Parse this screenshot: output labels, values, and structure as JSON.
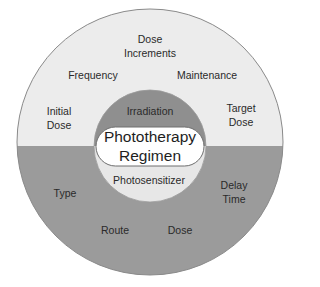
{
  "diagram": {
    "title": "Phototherapy Regimen",
    "center": {
      "line1": "Phototherapy",
      "line2": "Regimen"
    },
    "inner": {
      "top": "Irradiation",
      "bottom": "Photosensitizer"
    },
    "outer_top": {
      "items": [
        {
          "line1": "Initial",
          "line2": "Dose"
        },
        {
          "line1": "Frequency",
          "line2": ""
        },
        {
          "line1": "Dose",
          "line2": "Increments"
        },
        {
          "line1": "Maintenance",
          "line2": ""
        },
        {
          "line1": "Target",
          "line2": "Dose"
        }
      ]
    },
    "outer_bottom": {
      "items": [
        {
          "line1": "Type",
          "line2": ""
        },
        {
          "line1": "Route",
          "line2": ""
        },
        {
          "line1": "Dose",
          "line2": ""
        },
        {
          "line1": "Delay",
          "line2": "Time"
        }
      ]
    },
    "colors": {
      "light_fill": "#ececec",
      "dark_fill": "#9a9a9a",
      "inner_dark": "#8e8e8e",
      "inner_light": "#e6e6e6",
      "center_fill": "#ffffff",
      "stroke": "#7a7a7a"
    }
  }
}
